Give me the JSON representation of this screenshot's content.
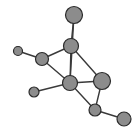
{
  "figure": {
    "width": 138,
    "height": 135,
    "background_color": "#ffffff"
  },
  "style": {
    "node_fill": "#8c8c8c",
    "node_stroke": "#2b2b2b",
    "node_stroke_width": 1.2,
    "node_highlight": "#a6a6a6",
    "edge_color": "#3a3a3a",
    "edge_width": 1.4
  },
  "chart_data": {
    "type": "scatter",
    "title": "",
    "xlabel": "",
    "ylabel": "",
    "xlim": [
      0,
      138
    ],
    "ylim": [
      0,
      135
    ],
    "grid": false,
    "legend": "none",
    "graph": {
      "directed": false,
      "node_count": 9,
      "edge_count": 12,
      "nodes": [
        {
          "id": "n1",
          "label": "",
          "x": 74,
          "y": 15,
          "r": 8.5,
          "degree": 1
        },
        {
          "id": "n2",
          "label": "",
          "x": 71,
          "y": 46,
          "r": 7.5,
          "degree": 4
        },
        {
          "id": "n3",
          "label": "",
          "x": 42,
          "y": 59,
          "r": 6.5,
          "degree": 3
        },
        {
          "id": "n4",
          "label": "",
          "x": 18,
          "y": 51,
          "r": 4.5,
          "degree": 1
        },
        {
          "id": "n5",
          "label": "",
          "x": 70,
          "y": 83,
          "r": 7.5,
          "degree": 5
        },
        {
          "id": "n6",
          "label": "",
          "x": 102,
          "y": 81,
          "r": 8.5,
          "degree": 3
        },
        {
          "id": "n7",
          "label": "",
          "x": 34,
          "y": 92,
          "r": 5.0,
          "degree": 1
        },
        {
          "id": "n8",
          "label": "",
          "x": 95,
          "y": 110,
          "r": 6.0,
          "degree": 3
        },
        {
          "id": "n9",
          "label": "",
          "x": 124,
          "y": 119,
          "r": 7.0,
          "degree": 1
        }
      ],
      "edges": [
        {
          "source": "n1",
          "target": "n2"
        },
        {
          "source": "n2",
          "target": "n3"
        },
        {
          "source": "n2",
          "target": "n5"
        },
        {
          "source": "n2",
          "target": "n6"
        },
        {
          "source": "n3",
          "target": "n4"
        },
        {
          "source": "n3",
          "target": "n5"
        },
        {
          "source": "n5",
          "target": "n6"
        },
        {
          "source": "n5",
          "target": "n7"
        },
        {
          "source": "n5",
          "target": "n8"
        },
        {
          "source": "n6",
          "target": "n8"
        },
        {
          "source": "n8",
          "target": "n9"
        },
        {
          "source": "n5",
          "target": "n1"
        }
      ]
    }
  }
}
